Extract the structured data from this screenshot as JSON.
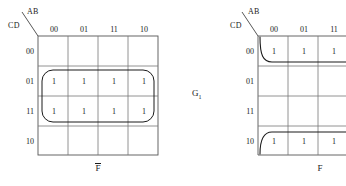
{
  "figure": {
    "type": "karnaugh-map-pair",
    "middle_label_base": "G",
    "middle_label_sub": "1"
  },
  "maps": [
    {
      "id": "left",
      "header_top_var": "AB",
      "header_side_var": "CD",
      "col_labels": [
        "00",
        "01",
        "11",
        "10"
      ],
      "row_labels": [
        "00",
        "01",
        "11",
        "10"
      ],
      "caption": "F",
      "caption_overbar": true,
      "cells": [
        [
          "",
          "",
          "",
          ""
        ],
        [
          "1",
          "1",
          "1",
          "1"
        ],
        [
          "1",
          "1",
          "1",
          "1"
        ],
        [
          "",
          "",
          "",
          ""
        ]
      ],
      "groups": [
        {
          "name": "group-rows-01-11",
          "shape": "rounded-rect",
          "rows": [
            "01",
            "11"
          ],
          "cols": [
            "00",
            "01",
            "11",
            "10"
          ],
          "size": 8
        }
      ],
      "truncated": false
    },
    {
      "id": "right",
      "header_top_var": "AB",
      "header_side_var": "CD",
      "col_labels": [
        "00",
        "01",
        "11"
      ],
      "row_labels": [
        "00",
        "01",
        "11",
        "10"
      ],
      "caption": "F",
      "caption_overbar": false,
      "cells": [
        [
          "1",
          "1",
          "1"
        ],
        [
          "",
          "",
          ""
        ],
        [
          "",
          "",
          ""
        ],
        [
          "1",
          "1",
          "1"
        ]
      ],
      "groups": [
        {
          "name": "group-row-00-wrap",
          "shape": "wrap-open-right",
          "rows": [
            "00"
          ],
          "cols": [
            "00",
            "01",
            "11"
          ]
        },
        {
          "name": "group-row-10-wrap",
          "shape": "wrap-open-right",
          "rows": [
            "10"
          ],
          "cols": [
            "00",
            "01",
            "11"
          ]
        }
      ],
      "truncated": true
    }
  ],
  "colors": {
    "grid_line": "#6f6f6f",
    "grid_border": "#444444",
    "group_line": "#1a1a1a",
    "text": "#1a1a1a",
    "background": "#ffffff"
  }
}
